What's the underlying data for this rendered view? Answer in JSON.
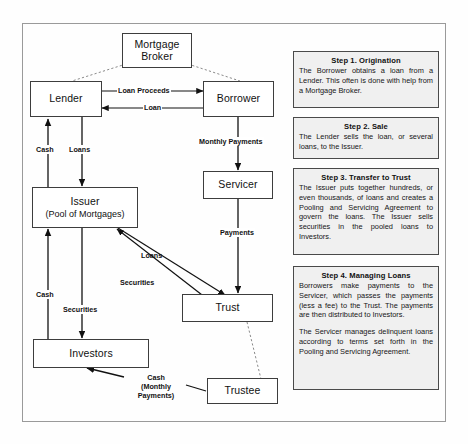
{
  "figure": {
    "border_color": "#9a9a9a",
    "panel_bg": "#f0f0f0",
    "node_border": "#3d3d3d"
  },
  "nodes": {
    "mortgage_broker": {
      "label_line1": "Mortgage",
      "label_line2": "Broker"
    },
    "lender": {
      "label": "Lender"
    },
    "borrower": {
      "label": "Borrower"
    },
    "issuer": {
      "label": "Issuer",
      "sublabel": "(Pool of Mortgages)"
    },
    "servicer": {
      "label": "Servicer"
    },
    "trust": {
      "label": "Trust"
    },
    "investors": {
      "label": "Investors"
    },
    "trustee": {
      "label": "Trustee"
    }
  },
  "edge_labels": {
    "loan_proceeds": "Loan Proceeds",
    "loan": "Loan",
    "cash_lender": "Cash",
    "loans_lender": "Loans",
    "monthly_payments": "Monthly Payments",
    "payments": "Payments",
    "loans_trust": "Loans",
    "securities_trust": "Securities",
    "cash_investors": "Cash",
    "securities_investors": "Securities",
    "cash_monthly_payments_l1": "Cash",
    "cash_monthly_payments_l2": "(Monthly",
    "cash_monthly_payments_l3": "Payments)"
  },
  "steps": [
    {
      "title": "Step 1. Origination",
      "paragraphs": [
        "The Borrower obtains a loan from a Lender. This often is done with help from a Mortgage Broker."
      ]
    },
    {
      "title": "Step 2. Sale",
      "paragraphs": [
        "The Lender sells the loan, or several loans, to the Issuer."
      ]
    },
    {
      "title": "Step 3. Transfer to Trust",
      "paragraphs": [
        "The Issuer puts together hundreds, or even thousands, of loans and creates a Pooling and Servicing Agreement to govern the loans. The Issuer sells securities in the pooled loans to Investors."
      ]
    },
    {
      "title": "Step 4. Managing Loans",
      "paragraphs": [
        "Borrowers make payments to the Servicer, which passes the payments (less a fee) to the Trust. The payments are then distributed to Investors.",
        "The Servicer manages delinquent loans according to terms set forth in the Pooling and Servicing Agreement."
      ]
    }
  ]
}
